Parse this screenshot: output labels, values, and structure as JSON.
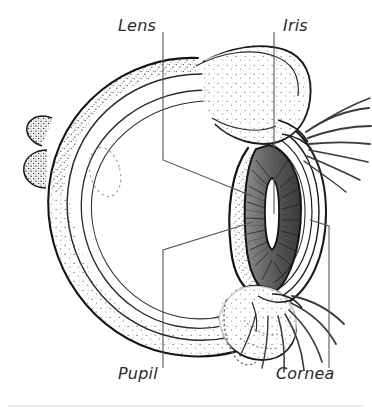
{
  "figure": {
    "view": "sagittal cross-section, left-facing",
    "background_color": "#ffffff",
    "ink_color": "#1a1a1a",
    "label_color": "#2b2b2b",
    "label_style": "italic",
    "leader_color": "#555555"
  },
  "labels": [
    {
      "id": "lens",
      "text": "Lens",
      "position": "top-left",
      "x": 118,
      "y": 16,
      "leader": "vertical then diagonal down-right to lens body"
    },
    {
      "id": "iris",
      "text": "Iris",
      "position": "top-right",
      "x": 283,
      "y": 16,
      "leader": "straight vertical down to iris"
    },
    {
      "id": "pupil",
      "text": "Pupil",
      "position": "bottom-left",
      "x": 118,
      "y": 364,
      "leader": "vertical then diagonal up-right to pupil slit"
    },
    {
      "id": "cornea",
      "text": "Cornea",
      "position": "bottom-right",
      "x": 276,
      "y": 364,
      "leader": "vertical then diagonal up-left to cornea"
    }
  ],
  "structures": [
    {
      "name": "sclera",
      "description": "outer white globe wall with stippled shading"
    },
    {
      "name": "choroid",
      "description": "inner concentric layer lines"
    },
    {
      "name": "retina",
      "description": "innermost concentric line"
    },
    {
      "name": "lens",
      "description": "large almond-shaped body at front of globe, stippled"
    },
    {
      "name": "iris",
      "description": "dark radially striated ring around pupil"
    },
    {
      "name": "pupil",
      "description": "vertical white slit, feline"
    },
    {
      "name": "cornea",
      "description": "transparent curved layers over iris and pupil"
    },
    {
      "name": "upper-eyelid",
      "description": "stippled lid with lashes fanning right"
    },
    {
      "name": "lower-eyelid",
      "description": "stippled lid with lashes fanning down-right"
    },
    {
      "name": "optic-nerve",
      "description": "stub at rear-left of globe"
    }
  ],
  "footer": {
    "rule": "thin horizontal divider near bottom edge"
  }
}
